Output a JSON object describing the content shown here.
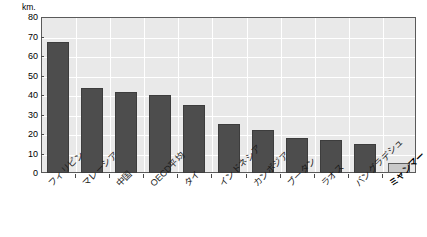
{
  "chart_data": {
    "type": "bar",
    "title": "",
    "subtitle": "",
    "xlabel": "",
    "ylabel": "km.",
    "unit_label": "km.",
    "ylim": [
      0,
      80
    ],
    "ytick_step": 10,
    "yticks": [
      80,
      70,
      60,
      50,
      40,
      30,
      20,
      10,
      0
    ],
    "grid": true,
    "legend": false,
    "legend_position": "none",
    "categories": [
      "フィリピン",
      "マレーシア",
      "中国",
      "OECD平均",
      "タイ",
      "インドネシア",
      "カンボジア",
      "ブータン",
      "ラオス",
      "バングラデシュ",
      "ミャンマー"
    ],
    "values": [
      67,
      43.5,
      41.5,
      40,
      35,
      25,
      22,
      18,
      17,
      15,
      5
    ],
    "highlight_index": 10,
    "bar_colors": {
      "default": "#4d4d4d",
      "highlight": "#c9c9c9",
      "default_border": "#3d3d3d",
      "highlight_border": "#5d5d5d"
    },
    "plot_background": "#e9e9e9",
    "gridline_color": "#ffffff",
    "frame_color": "#5a5a5a"
  }
}
